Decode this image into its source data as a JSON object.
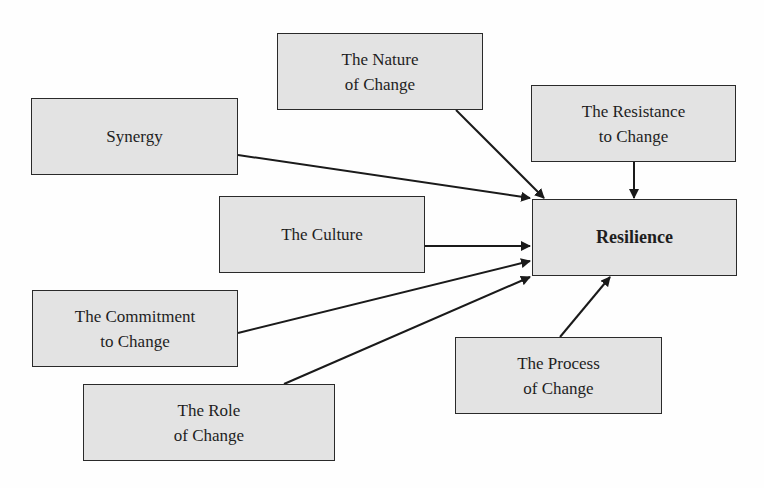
{
  "diagram": {
    "target": {
      "id": "resilience",
      "label": "Resilience"
    },
    "nodes": [
      {
        "id": "nature",
        "label": "The Nature\nof Change"
      },
      {
        "id": "synergy",
        "label": "Synergy"
      },
      {
        "id": "resistance",
        "label": "The Resistance\nto Change"
      },
      {
        "id": "culture",
        "label": "The Culture"
      },
      {
        "id": "commitment",
        "label": "The Commitment\nto Change"
      },
      {
        "id": "role",
        "label": "The Role\nof Change"
      },
      {
        "id": "process",
        "label": "The Process\nof Change"
      }
    ],
    "edges": [
      {
        "from": "nature",
        "to": "resilience"
      },
      {
        "from": "synergy",
        "to": "resilience"
      },
      {
        "from": "resistance",
        "to": "resilience"
      },
      {
        "from": "culture",
        "to": "resilience"
      },
      {
        "from": "commitment",
        "to": "resilience"
      },
      {
        "from": "role",
        "to": "resilience"
      },
      {
        "from": "process",
        "to": "resilience"
      }
    ]
  },
  "colors": {
    "box_fill": "#e3e3e3",
    "stroke": "#2a2a2a",
    "text": "#1e1e1e"
  }
}
